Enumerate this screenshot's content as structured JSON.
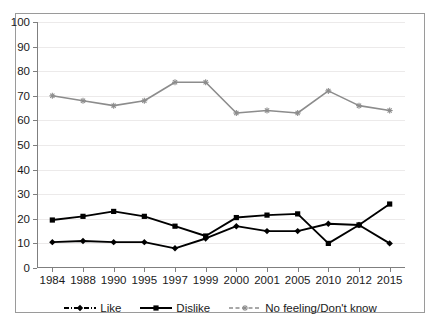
{
  "chart_data": {
    "type": "line",
    "title": "",
    "xlabel": "",
    "ylabel": "",
    "ylim": [
      0,
      100
    ],
    "yticks": [
      0,
      10,
      20,
      30,
      40,
      50,
      60,
      70,
      80,
      90,
      100
    ],
    "grid": true,
    "legend_position": "bottom",
    "categories": [
      "1984",
      "1988",
      "1990",
      "1995",
      "1997",
      "1999",
      "2000",
      "2001",
      "2005",
      "2010",
      "2012",
      "2015"
    ],
    "series": [
      {
        "name": "Like",
        "color": "#000000",
        "marker": "diamond",
        "linestyle": "dash-dot",
        "values": [
          10.5,
          11,
          10.5,
          10.5,
          8,
          12,
          17,
          15,
          15,
          18,
          17.5,
          10
        ]
      },
      {
        "name": "Dislike",
        "color": "#000000",
        "marker": "square",
        "linestyle": "solid",
        "values": [
          19.5,
          21,
          23,
          21,
          17,
          13,
          20.5,
          21.5,
          22,
          10,
          17.5,
          26
        ]
      },
      {
        "name": "No feeling/Don't know",
        "color": "#8c8c8c",
        "marker": "star",
        "linestyle": "dashed",
        "values": [
          70,
          68,
          66,
          68,
          75.5,
          75.5,
          63,
          64,
          63,
          72,
          66,
          64
        ]
      }
    ]
  },
  "colors": {
    "frame_border": "#9a9a9a",
    "axis": "#7f7f7f",
    "gridline": "#eceaea",
    "text": "#1a1a1a",
    "background": "#ffffff"
  }
}
